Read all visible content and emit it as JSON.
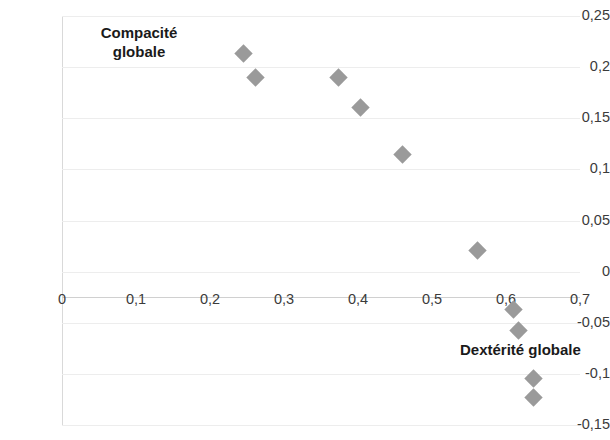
{
  "chart_data": {
    "type": "scatter",
    "title": "",
    "xlabel": "Dextérité globale",
    "ylabel": "Compacité globale",
    "ylabel_line1": "Compacité",
    "ylabel_line2": "globale",
    "xlim": [
      0,
      0.7
    ],
    "ylim": [
      -0.15,
      0.25
    ],
    "grid": true,
    "legend": "none",
    "marker": "diamond",
    "marker_color": "#9a9a9a",
    "x_ticks": [
      "0",
      "0,1",
      "0,2",
      "0,3",
      "0,4",
      "0,5",
      "0,6",
      "0,7"
    ],
    "x_tick_values": [
      0,
      0.1,
      0.2,
      0.3,
      0.4,
      0.5,
      0.6,
      0.7
    ],
    "y_ticks": [
      "0,25",
      "0,2",
      "0,15",
      "0,1",
      "0,05",
      "0",
      "-0,05",
      "-0,1",
      "-0,15"
    ],
    "y_tick_values": [
      0.25,
      0.2,
      0.15,
      0.1,
      0.05,
      0,
      -0.05,
      -0.1,
      -0.15
    ],
    "points": [
      {
        "x": 0.245,
        "y": 0.213
      },
      {
        "x": 0.262,
        "y": 0.19
      },
      {
        "x": 0.373,
        "y": 0.19
      },
      {
        "x": 0.404,
        "y": 0.161
      },
      {
        "x": 0.46,
        "y": 0.115
      },
      {
        "x": 0.561,
        "y": 0.021
      },
      {
        "x": 0.61,
        "y": -0.037
      },
      {
        "x": 0.617,
        "y": -0.058
      },
      {
        "x": 0.637,
        "y": -0.105
      },
      {
        "x": 0.637,
        "y": -0.123
      }
    ]
  }
}
